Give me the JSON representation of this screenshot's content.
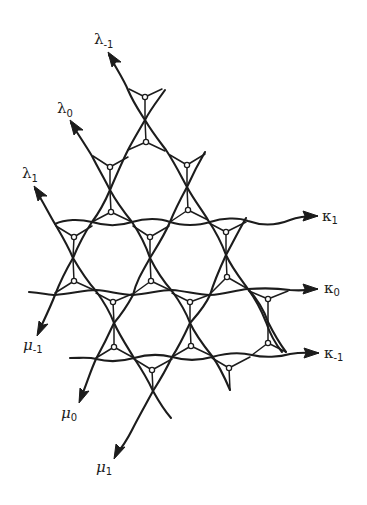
{
  "diagram": {
    "colors": {
      "ink": "#1c1c1c",
      "background": "#ffffff"
    },
    "strand_families": {
      "lambda": [
        {
          "symbol": "λ",
          "subscript": "-1",
          "label": "λ-1"
        },
        {
          "symbol": "λ",
          "subscript": "0",
          "label": "λ0"
        },
        {
          "symbol": "λ",
          "subscript": "1",
          "label": "λ1"
        }
      ],
      "kappa": [
        {
          "symbol": "κ",
          "subscript": "1",
          "label": "κ1"
        },
        {
          "symbol": "κ",
          "subscript": "0",
          "label": "κ0"
        },
        {
          "symbol": "κ",
          "subscript": "-1",
          "label": "κ-1"
        }
      ],
      "mu": [
        {
          "symbol": "μ",
          "subscript": "-1",
          "label": "μ-1"
        },
        {
          "symbol": "μ",
          "subscript": "0",
          "label": "μ0"
        },
        {
          "symbol": "μ",
          "subscript": "1",
          "label": "μ1"
        }
      ]
    }
  }
}
